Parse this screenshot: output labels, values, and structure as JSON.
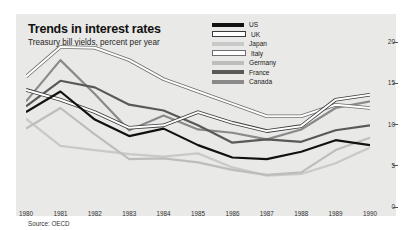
{
  "figure": {
    "title": "Trends in interest rates",
    "subtitle": "Treasury bill yields, percent per year",
    "source": "Source: OECD",
    "panel_bg": "#e9e9e7",
    "page_bg": "#ffffff"
  },
  "chart_data": {
    "type": "line",
    "title": "Trends in interest rates",
    "subtitle": "Treasury bill yields, percent per year",
    "xlabel": "",
    "ylabel": "",
    "ylim": [
      0,
      20
    ],
    "yticks": [
      0,
      5,
      10,
      15,
      20
    ],
    "y_axis_position": "right",
    "grid": false,
    "legend_position": "top-right",
    "source": "Source: OECD",
    "categories": [
      "1980",
      "1981",
      "1982",
      "1983",
      "1984",
      "1985",
      "1986",
      "1987",
      "1988",
      "1989",
      "1990"
    ],
    "x": [
      1980,
      1981,
      1982,
      1983,
      1984,
      1985,
      1986,
      1987,
      1988,
      1989,
      1990
    ],
    "series": [
      {
        "name": "US",
        "color": "#111111",
        "style": "solid",
        "values": [
          11.5,
          14.0,
          10.6,
          8.6,
          9.5,
          7.5,
          6.0,
          5.8,
          6.7,
          8.1,
          7.5
        ]
      },
      {
        "name": "UK",
        "color": "#ffffff",
        "outline": "#3a3a3a",
        "style": "outlined",
        "values": [
          14.2,
          13.0,
          11.5,
          9.6,
          9.9,
          11.5,
          10.2,
          9.2,
          9.8,
          13.0,
          13.6
        ]
      },
      {
        "name": "Japan",
        "color": "#c9c9c9",
        "style": "solid",
        "values": [
          10.7,
          7.4,
          6.9,
          6.4,
          6.1,
          6.5,
          4.8,
          3.8,
          4.0,
          5.3,
          7.2
        ]
      },
      {
        "name": "Italy",
        "color": "#ffffff",
        "outline": "#6e6e6e",
        "style": "outlined",
        "values": [
          15.8,
          19.4,
          19.3,
          17.8,
          15.5,
          14.0,
          12.5,
          11.0,
          11.0,
          12.4,
          12.0
        ]
      },
      {
        "name": "Germany",
        "color": "#bdbdbd",
        "style": "solid",
        "values": [
          9.5,
          12.0,
          8.8,
          5.8,
          5.9,
          5.4,
          4.5,
          3.9,
          4.2,
          6.9,
          8.4
        ]
      },
      {
        "name": "France",
        "color": "#595959",
        "style": "solid",
        "values": [
          12.2,
          15.3,
          14.5,
          12.4,
          11.7,
          9.9,
          7.8,
          8.2,
          7.9,
          9.3,
          9.9
        ]
      },
      {
        "name": "Canada",
        "color": "#8a8a8a",
        "style": "solid",
        "values": [
          12.8,
          17.8,
          13.7,
          9.3,
          11.1,
          9.4,
          9.0,
          8.2,
          9.4,
          12.0,
          12.8
        ]
      }
    ]
  }
}
